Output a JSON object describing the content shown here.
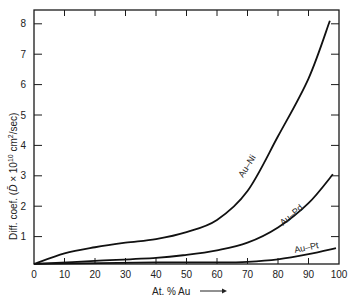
{
  "chart_data": {
    "type": "line",
    "title": "",
    "xlabel": "At. % Au",
    "ylabel": "Diff. coef. (D̄ × 10¹⁰ cm²/sec)",
    "xlim": [
      0,
      100
    ],
    "ylim": [
      0,
      8.5
    ],
    "x_ticks": [
      0,
      10,
      20,
      30,
      40,
      50,
      60,
      70,
      80,
      90,
      100
    ],
    "y_ticks": [
      1,
      2,
      3,
      4,
      5,
      6,
      7,
      8
    ],
    "grid": false,
    "legend": "inline curve labels",
    "series": [
      {
        "name": "Au–Ni",
        "x": [
          0,
          10,
          20,
          30,
          40,
          50,
          60,
          70,
          80,
          90,
          97
        ],
        "y": [
          0.1,
          0.45,
          0.65,
          0.8,
          0.92,
          1.15,
          1.55,
          2.5,
          4.3,
          6.2,
          8.1
        ]
      },
      {
        "name": "Au–Pd",
        "x": [
          0,
          20,
          40,
          50,
          60,
          70,
          80,
          90,
          98
        ],
        "y": [
          0.1,
          0.2,
          0.3,
          0.4,
          0.55,
          0.8,
          1.3,
          2.1,
          3.05
        ]
      },
      {
        "name": "Au–Pt",
        "x": [
          0,
          40,
          60,
          70,
          80,
          90,
          99
        ],
        "y": [
          0.1,
          0.15,
          0.15,
          0.17,
          0.25,
          0.42,
          0.62
        ]
      }
    ]
  },
  "labels": {
    "xlabel": "At. % Au",
    "ylabel_part1": "Diff. coef. (",
    "ylabel_D": "D̄",
    "ylabel_part2": " × 10",
    "ylabel_exp": "10",
    "ylabel_part3": " cm",
    "ylabel_sq": "2",
    "ylabel_part4": "/sec)",
    "curve_ni": "Au–Ni",
    "curve_pd": "Au–Pd",
    "curve_pt": "Au–Pt"
  }
}
